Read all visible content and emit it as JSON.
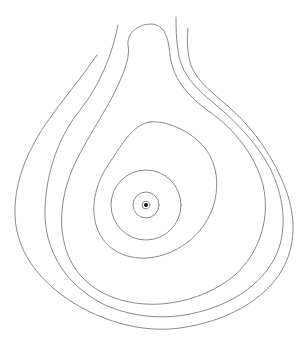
{
  "diagram": {
    "type": "contour-map",
    "background": "#ffffff",
    "line_color": "#8a8a8a",
    "center_dot_color": "#111111",
    "center": {
      "x": 146,
      "y": 205
    },
    "contours": [
      {
        "id": "contour-1-outermost",
        "closed": false
      },
      {
        "id": "contour-2",
        "closed": false
      },
      {
        "id": "contour-3-knob",
        "closed": false
      },
      {
        "id": "contour-4-egg",
        "closed": true
      },
      {
        "id": "contour-5-circle",
        "closed": true,
        "r": 35
      },
      {
        "id": "contour-6-circle",
        "closed": true,
        "r": 13
      },
      {
        "id": "contour-7-circle",
        "closed": true,
        "r": 4
      }
    ],
    "center_dot_radius": 2
  }
}
